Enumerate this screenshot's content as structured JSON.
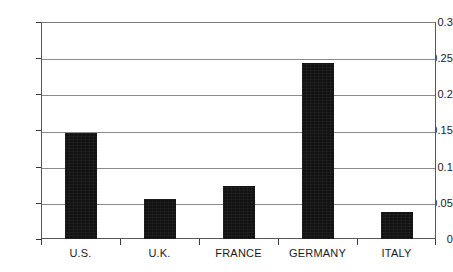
{
  "chart_data": {
    "type": "bar",
    "title": "",
    "subtitle": "",
    "xlabel": "",
    "ylabel": "",
    "categories": [
      "U.S.",
      "U.K.",
      "FRANCE",
      "GERMANY",
      "ITALY"
    ],
    "values": [
      0.147,
      0.055,
      0.073,
      0.243,
      0.038
    ],
    "series": [
      {
        "name": "",
        "values": [
          0.147,
          0.055,
          0.073,
          0.243,
          0.038
        ],
        "color": "#121212"
      }
    ],
    "ylim": [
      0,
      0.3
    ],
    "xlim": [
      0,
      5
    ],
    "ytick_labels": [
      "0",
      "0.05",
      "0.1",
      "0.15",
      "0.2",
      "0.25",
      "0.3"
    ],
    "ytick_values": [
      0,
      0.05,
      0.1,
      0.15,
      0.2,
      0.25,
      0.3
    ],
    "grid": "horizontal",
    "legend": "none",
    "annotations": [],
    "colors": {
      "bar": "#121212",
      "gridline": "#8a8a8c",
      "axis": "#58585a",
      "background": "#ffffff",
      "text": "#1a1a1a"
    }
  }
}
